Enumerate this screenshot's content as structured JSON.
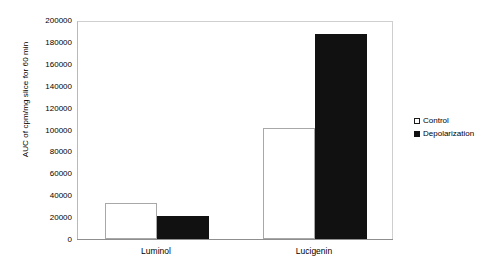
{
  "chart_data": {
    "type": "bar",
    "title": "",
    "xlabel": "",
    "ylabel": "AUC of cpm/mg slice for 60 min",
    "categories": [
      "Luminol",
      "Lucigenin"
    ],
    "series": [
      {
        "name": "Control",
        "values": [
          33000,
          101000
        ],
        "color": "#ffffff"
      },
      {
        "name": "Depolarization",
        "values": [
          21000,
          187000
        ],
        "color": "#111111"
      }
    ],
    "ylim": [
      0,
      200000
    ],
    "ytick_step": 20000,
    "yticks": [
      "200000",
      "180000",
      "160000",
      "140000",
      "120000",
      "100000",
      "80000",
      "60000",
      "40000",
      "20000",
      "0"
    ],
    "grid": false,
    "legend_position": "right"
  },
  "legend": {
    "items": [
      {
        "label": "Control",
        "marker": "hollow-square-marker"
      },
      {
        "label": "Depolarization",
        "marker": "filled-square-marker"
      }
    ]
  }
}
